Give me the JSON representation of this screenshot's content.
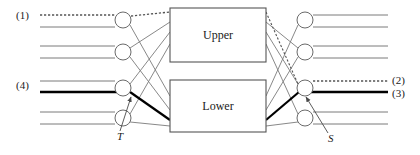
{
  "diagram": {
    "type": "switching-network-schematic",
    "title": "",
    "boxes": [
      {
        "id": "upper",
        "label": "Upper",
        "x": 170,
        "y": 8,
        "w": 96,
        "h": 54
      },
      {
        "id": "lower",
        "label": "Lower",
        "x": 170,
        "y": 80,
        "w": 96,
        "h": 52
      }
    ],
    "port_labels": {
      "left": [
        {
          "id": "p1",
          "text": "(1)",
          "x": 16,
          "y": 14,
          "row": 1
        },
        {
          "id": "p4",
          "text": "(4)",
          "x": 16,
          "y": 78,
          "row": 3
        }
      ],
      "right": [
        {
          "id": "p2",
          "text": "(2)",
          "x": 392,
          "y": 71,
          "row": 3
        },
        {
          "id": "p3",
          "text": "(3)",
          "x": 392,
          "y": 85,
          "row": 3
        }
      ]
    },
    "annotations": [
      {
        "id": "T",
        "text": "T",
        "x": 119,
        "y": 132,
        "arrow_to_x": 131,
        "arrow_to_y": 97,
        "side": "left"
      },
      {
        "id": "S",
        "text": "S",
        "x": 327,
        "y": 134,
        "arrow_to_x": 305,
        "arrow_to_y": 97,
        "side": "right"
      }
    ],
    "left_nodes": [
      {
        "id": "L1",
        "cx": 123,
        "cy": 20,
        "r": 8
      },
      {
        "id": "L2",
        "cx": 123,
        "cy": 52,
        "r": 8
      },
      {
        "id": "L3",
        "cx": 123,
        "cy": 88,
        "r": 8
      },
      {
        "id": "L4",
        "cx": 123,
        "cy": 118,
        "r": 8
      }
    ],
    "right_nodes": [
      {
        "id": "R1",
        "cx": 305,
        "cy": 20,
        "r": 8
      },
      {
        "id": "R2",
        "cx": 305,
        "cy": 52,
        "r": 8
      },
      {
        "id": "R3",
        "cx": 305,
        "cy": 88,
        "r": 8
      },
      {
        "id": "R4",
        "cx": 305,
        "cy": 118,
        "r": 8
      }
    ],
    "colors": {
      "line": "#7a7a7a",
      "line_dark": "#000000",
      "box_stroke": "#555555",
      "text": "#1a1a1a",
      "background": "#ffffff"
    },
    "line_styles": {
      "normal": "thin-gray",
      "highlight": "thick-black",
      "route": "dotted"
    },
    "legend_note": ""
  }
}
